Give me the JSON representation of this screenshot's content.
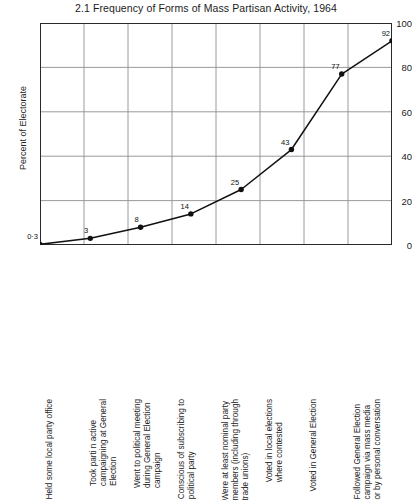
{
  "chart_data": {
    "type": "line",
    "title": "2.1 Frequency of Forms of Mass Partisan Activity, 1964",
    "xlabel": "",
    "ylabel": "Percent of Electorate",
    "ylim": [
      0,
      100
    ],
    "yticks": [
      0,
      20,
      40,
      60,
      80,
      100
    ],
    "ytick_labels": [
      "0",
      "20",
      "40",
      "60",
      "80",
      "100"
    ],
    "grid": true,
    "legend": false,
    "marker": "filled-circle",
    "line_color": "#111111",
    "categories": [
      "Held some local party office",
      "Took parti n active\ncampaigning at General\nElection",
      "Went to political meeting\nduring General Election\ncampaign",
      "Conscious of subscribing to\npolitical party",
      "Were at least nominal party\nmembers (including through\ntrade unions)",
      "Voted in local elections\nwhere contested",
      "Voted in General Election",
      "Followed General Election\ncampaign via mass media\nor by personal conversation"
    ],
    "values": [
      0.3,
      3,
      8,
      14,
      25,
      43,
      77,
      92
    ],
    "point_labels": [
      "0·3",
      "3",
      "8",
      "14",
      "25",
      "43",
      "77",
      "92"
    ]
  }
}
